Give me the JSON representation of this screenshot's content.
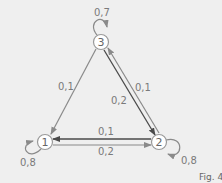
{
  "diagram": {
    "type": "markov-chain",
    "caption": "Fig. 4",
    "colors": {
      "background": "#efefef",
      "edge_light": "#8a8a8a",
      "edge_dark": "#4a4a4a",
      "node_fill": "#ffffff",
      "node_stroke": "#9a9a9a",
      "label": "#7a7a7a"
    },
    "nodes": [
      {
        "id": "1",
        "label": "1"
      },
      {
        "id": "2",
        "label": "2"
      },
      {
        "id": "3",
        "label": "3"
      }
    ],
    "edges": [
      {
        "from": "3",
        "to": "3",
        "label": "0,7"
      },
      {
        "from": "1",
        "to": "1",
        "label": "0,8"
      },
      {
        "from": "2",
        "to": "2",
        "label": "0,8"
      },
      {
        "from": "3",
        "to": "1",
        "label": "0,1"
      },
      {
        "from": "3",
        "to": "2",
        "label": "0,2"
      },
      {
        "from": "2",
        "to": "3",
        "label": "0,1"
      },
      {
        "from": "2",
        "to": "1",
        "label": "0,1"
      },
      {
        "from": "1",
        "to": "2",
        "label": "0,2"
      }
    ]
  }
}
